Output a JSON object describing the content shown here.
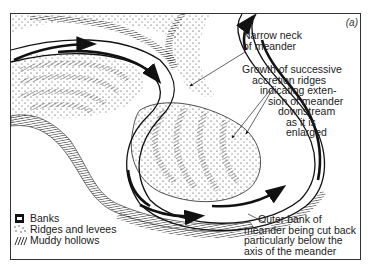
{
  "figure": {
    "panel_label": "(a)"
  },
  "labels": {
    "neck": [
      "Narrow neck",
      "of meander"
    ],
    "growth": [
      "Growth of successive",
      "accretion ridges",
      "indicating exten-",
      "sion of meander",
      "downstream",
      "as it is",
      "enlarged"
    ],
    "outer_bank": [
      "Outer bank of",
      "meander being cut back",
      "particularly below the",
      "axis of the meander"
    ]
  },
  "legend": {
    "items": [
      {
        "symbol": "banks-swatch-icon",
        "label": "Banks"
      },
      {
        "symbol": "ridges-dots-icon",
        "label": "Ridges and levees"
      },
      {
        "symbol": "hollows-hatch-icon",
        "label": "Muddy hollows"
      }
    ]
  },
  "colors": {
    "ink": "#1a1a1a",
    "background": "#ffffff"
  }
}
